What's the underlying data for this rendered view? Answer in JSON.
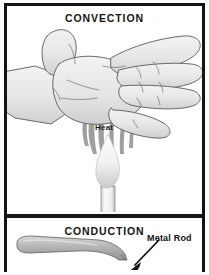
{
  "figure": {
    "title_top": "CONVECTION",
    "title_bottom": "CONDUCTION",
    "panels": [
      {
        "name": "convection",
        "heading": "CONVECTION",
        "labels": [
          {
            "name": "heat-label",
            "text": "Heat"
          }
        ],
        "objects": [
          {
            "name": "hand",
            "description": "open hand held above a candle flame, fingers spread, palm facing down"
          },
          {
            "name": "candle",
            "description": "lit candle standing below the hand"
          },
          {
            "name": "flame",
            "description": "candle flame"
          },
          {
            "name": "heat-wisps",
            "description": "rising wisps of hot air around and through the fingers"
          }
        ]
      },
      {
        "name": "conduction",
        "heading": "CONDUCTION",
        "labels": [
          {
            "name": "metal-rod-label",
            "text": "Metal Rod"
          }
        ],
        "objects": [
          {
            "name": "metal-rod",
            "description": "long tapering metal rod entering from the left"
          },
          {
            "name": "callout-arrow",
            "description": "arrow pointing from the Metal Rod label down-left to the rod tip"
          }
        ]
      }
    ],
    "colors": {
      "border": "#141414",
      "background": "#ffffff",
      "skin_fill": "#e9e9e9",
      "outline": "#4a4a4a",
      "heat_wisp": "#8c8c8c",
      "flame_fill": "#f2f2f2",
      "rod_fill": "#b5b5b5",
      "text": "#141414"
    }
  }
}
